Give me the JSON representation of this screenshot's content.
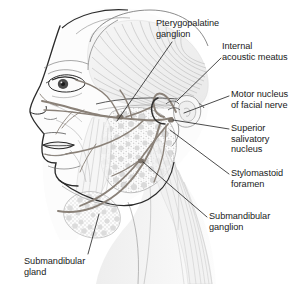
{
  "figure": {
    "background_color": "#ffffff",
    "line_color": "#2b2b2b",
    "nerve_color": "#8a8178",
    "muscle_shade_color": "#c9c9c9",
    "text_color": "#1a1a1a"
  },
  "labels": [
    {
      "id": "pterygopalatine-ganglion",
      "text": "Pterygopalatine\nganglion",
      "x": 156,
      "y": 18,
      "align": "left",
      "leader_from": [
        172,
        42
      ],
      "leader_to": [
        116,
        122
      ]
    },
    {
      "id": "internal-acoustic-meatus",
      "text": "Internal\nacoustic meatus",
      "x": 222,
      "y": 42,
      "align": "left",
      "leader_from": [
        220,
        58
      ],
      "leader_to": [
        176,
        101
      ]
    },
    {
      "id": "motor-nucleus-of-facial-nerve",
      "text": "Motor nucleus\nof facial nerve",
      "x": 231,
      "y": 90,
      "align": "left",
      "leader_from": [
        229,
        96
      ],
      "leader_to": [
        184,
        112
      ]
    },
    {
      "id": "superior-salivatory-nucleus",
      "text": "Superior\nsalivatory\nnucleus",
      "x": 231,
      "y": 124,
      "align": "left",
      "leader_from": [
        229,
        129
      ],
      "leader_to": [
        172,
        120
      ]
    },
    {
      "id": "stylomastoid-foramen",
      "text": "Stylomastoid\nforamen",
      "x": 231,
      "y": 169,
      "align": "left",
      "leader_from": [
        229,
        174
      ],
      "leader_to": [
        170,
        130
      ]
    },
    {
      "id": "submandibular-ganglion",
      "text": "Submandibular\nganglion",
      "x": 209,
      "y": 212,
      "align": "left",
      "leader_from": [
        207,
        217
      ],
      "leader_to": [
        141,
        161
      ]
    },
    {
      "id": "submandibular-gland",
      "text": "Submandibular\ngland",
      "x": 24,
      "y": 257,
      "align": "left",
      "leader_from": [
        88,
        256
      ],
      "leader_to": [
        98,
        215
      ]
    }
  ],
  "anatomy": {
    "structures": [
      {
        "name": "facial-profile",
        "description": "outline of forehead, nose, lips and chin in left lateral view"
      },
      {
        "name": "eye",
        "description": "eye with upper lid, iris and lashes"
      },
      {
        "name": "temporalis-muscle",
        "description": "fan-shaped muscle with radiating fibers over the temple"
      },
      {
        "name": "parotid-gland",
        "description": "stippled lobular gland anterior to the ear"
      },
      {
        "name": "submandibular-gland",
        "description": "stippled gland beneath the mandible"
      },
      {
        "name": "masseter-muscle",
        "description": "vertically striated muscle over the ramus of the mandible"
      },
      {
        "name": "sternocleidomastoid-muscle",
        "description": "long striated muscle descending into the neck"
      },
      {
        "name": "external-ear",
        "description": "auricle and temporal bone region"
      },
      {
        "name": "facial-nerve-trunk",
        "description": "nerve emerging at the stylomastoid foramen"
      },
      {
        "name": "facial-nerve-branches",
        "description": "temporal, zygomatic, buccal, marginal mandibular and cervical branches fanning across the face"
      },
      {
        "name": "chorda-tympani",
        "description": "branch running forward to the submandibular ganglion"
      },
      {
        "name": "greater-petrosal-nerve",
        "description": "nerve loop above the internal acoustic meatus toward the pterygopalatine ganglion"
      },
      {
        "name": "mandible-outline",
        "description": "jaw line and ramus"
      }
    ]
  }
}
